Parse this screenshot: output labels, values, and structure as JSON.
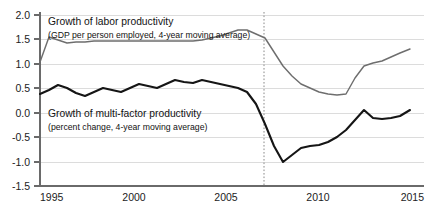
{
  "chart_data": {
    "type": "line",
    "title": "",
    "xlabel": "",
    "ylabel": "",
    "xlim": [
      1995,
      2015
    ],
    "ylim": [
      -1.5,
      2.0
    ],
    "grid": true,
    "legend_position": "inline-annotation",
    "x_ticks": [
      "1995",
      "2000",
      "2005",
      "2010",
      "2015"
    ],
    "x_tick_values": [
      1995,
      2000,
      2005,
      2010,
      2015
    ],
    "y_ticks": [
      "2.0",
      "1.5",
      "1.0",
      "0.5",
      "0.0",
      "-0.5",
      "-1.0",
      "-1.5"
    ],
    "y_tick_values": [
      2.0,
      1.5,
      1.0,
      0.5,
      0.0,
      -0.5,
      -1.0,
      -1.5
    ],
    "x": [
      1995,
      1996,
      1997,
      1998,
      1999,
      2000,
      2001,
      2002,
      2003,
      2004,
      2005,
      2006,
      2007,
      2008,
      2009,
      2010,
      2011,
      2012,
      2013,
      2014,
      2015
    ],
    "series": [
      {
        "name": "Growth of labor productivity",
        "color": "#6e6e6e",
        "values": [
          0.9,
          1.35,
          1.3,
          1.25,
          1.25,
          1.27,
          1.3,
          1.3,
          1.2,
          1.05,
          0.95,
          0.85,
          0.72,
          0.6,
          0.45,
          0.3,
          0.2,
          0.2,
          0.65,
          0.8,
          1.1
        ]
      },
      {
        "name": "Growth of multi-factor productivity",
        "color": "#151515",
        "values": [
          0.25,
          0.35,
          0.48,
          0.35,
          0.3,
          0.4,
          0.35,
          0.5,
          0.55,
          0.48,
          0.35,
          0.45,
          0.5,
          0.48,
          0.4,
          0.5,
          0.45,
          0.4,
          0.25,
          0.1,
          -0.1
        ]
      }
    ],
    "annotations": [
      {
        "name": "labor-productivity-label",
        "title": "Growth of labor productivity",
        "subtitle": "(GDP per person employed, 4-year moving average)"
      },
      {
        "name": "multifactor-productivity-label",
        "title": "Growth of multi-factor productivity",
        "subtitle": "(percent change, 4-year moving average)"
      }
    ],
    "vertical_marker": {
      "name": "crisis-marker",
      "value": 2007,
      "style": "dotted",
      "color": "#8a8a8a"
    }
  },
  "series_paths": {
    "gray_points": [
      [
        40,
        62
      ],
      [
        49,
        37
      ],
      [
        58,
        40
      ],
      [
        67,
        43
      ],
      [
        76,
        42
      ],
      [
        85,
        42
      ],
      [
        94,
        41
      ],
      [
        103,
        41
      ],
      [
        112,
        41
      ],
      [
        121,
        41
      ],
      [
        130,
        41
      ],
      [
        139,
        41
      ],
      [
        148,
        41
      ],
      [
        157,
        41
      ],
      [
        166,
        41
      ],
      [
        175,
        41
      ],
      [
        184,
        41
      ],
      [
        193,
        41
      ],
      [
        202,
        40
      ],
      [
        211,
        38
      ],
      [
        220,
        36
      ],
      [
        229,
        33
      ],
      [
        238,
        30
      ],
      [
        247,
        30
      ],
      [
        256,
        34
      ],
      [
        265,
        38
      ],
      [
        274,
        52
      ],
      [
        283,
        66
      ],
      [
        292,
        76
      ],
      [
        301,
        84
      ],
      [
        310,
        88
      ],
      [
        319,
        92
      ],
      [
        328,
        94
      ],
      [
        337,
        95
      ],
      [
        346,
        94
      ],
      [
        355,
        78
      ],
      [
        364,
        66
      ],
      [
        373,
        63
      ],
      [
        382,
        61
      ],
      [
        391,
        57
      ],
      [
        400,
        53
      ],
      [
        410,
        49
      ]
    ],
    "black_points": [
      [
        40,
        94
      ],
      [
        49,
        90
      ],
      [
        58,
        85
      ],
      [
        67,
        88
      ],
      [
        76,
        93
      ],
      [
        85,
        96
      ],
      [
        94,
        92
      ],
      [
        103,
        88
      ],
      [
        112,
        90
      ],
      [
        121,
        92
      ],
      [
        130,
        88
      ],
      [
        139,
        84
      ],
      [
        148,
        86
      ],
      [
        157,
        88
      ],
      [
        166,
        84
      ],
      [
        175,
        80
      ],
      [
        184,
        82
      ],
      [
        193,
        83
      ],
      [
        202,
        80
      ],
      [
        211,
        82
      ],
      [
        220,
        84
      ],
      [
        229,
        86
      ],
      [
        238,
        88
      ],
      [
        247,
        92
      ],
      [
        256,
        104
      ],
      [
        265,
        124
      ],
      [
        274,
        146
      ],
      [
        283,
        162
      ],
      [
        292,
        155
      ],
      [
        301,
        148
      ],
      [
        310,
        146
      ],
      [
        319,
        145
      ],
      [
        328,
        142
      ],
      [
        337,
        137
      ],
      [
        346,
        130
      ],
      [
        355,
        120
      ],
      [
        364,
        110
      ],
      [
        373,
        118
      ],
      [
        382,
        119
      ],
      [
        391,
        118
      ],
      [
        400,
        116
      ],
      [
        410,
        110
      ]
    ]
  }
}
